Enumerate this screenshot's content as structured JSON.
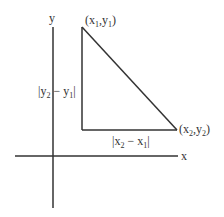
{
  "diagram": {
    "type": "coordinate-distance-triangle",
    "colors": {
      "line": "#333333",
      "text": "#333333",
      "background": "#ffffff"
    },
    "axes": {
      "x_label": "x",
      "y_label": "y"
    },
    "points": {
      "p1": {
        "label_open": "(x",
        "sub1": "1",
        "comma": ",y",
        "sub2": "1",
        "label_close": ")"
      },
      "p2": {
        "label_open": "(x",
        "sub1": "2",
        "comma": ",y",
        "sub2": "2",
        "label_close": ")"
      }
    },
    "side_labels": {
      "vertical": {
        "pre": "|y",
        "sub_a": "2",
        "mid": " − y",
        "sub_b": "1",
        "post": "|"
      },
      "horizontal": {
        "pre": "|x",
        "sub_a": "2",
        "mid": " − x",
        "sub_b": "1",
        "post": "|"
      }
    }
  }
}
